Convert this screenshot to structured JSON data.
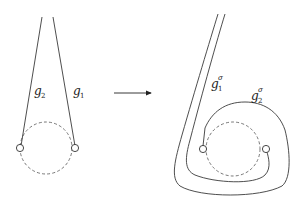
{
  "figure": {
    "left": {
      "labels": {
        "g2": {
          "base": "g",
          "sub": "2",
          "sup": ""
        },
        "g1": {
          "base": "g",
          "sub": "1",
          "sup": ""
        }
      }
    },
    "arrow": {
      "direction": "right"
    },
    "right": {
      "labels": {
        "g1sigma": {
          "base": "g",
          "sub": "1",
          "sup": "σ"
        },
        "g2sigma": {
          "base": "g",
          "sub": "2",
          "sup": "σ"
        }
      }
    }
  }
}
